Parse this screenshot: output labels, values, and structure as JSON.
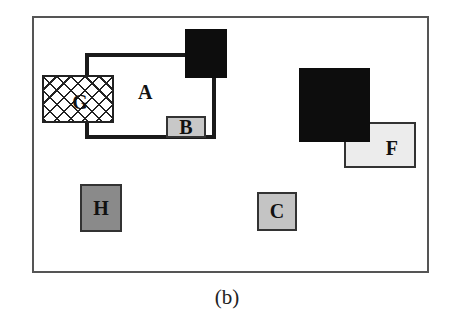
{
  "figure": {
    "caption": "(b)",
    "regions": [
      {
        "id": "A",
        "label": "A",
        "style": "thick-outline",
        "fill": "#ffffff"
      },
      {
        "id": "G",
        "label": "G",
        "style": "crosshatch",
        "fill": "#ffffff"
      },
      {
        "id": "B",
        "label": "B",
        "style": "filled",
        "fill": "#c8c8c8"
      },
      {
        "id": "F",
        "label": "F",
        "style": "filled",
        "fill": "#ececec"
      },
      {
        "id": "H",
        "label": "H",
        "style": "filled",
        "fill": "#8a8a8a"
      },
      {
        "id": "C",
        "label": "C",
        "style": "filled",
        "fill": "#c4c4c4"
      },
      {
        "id": "black-top",
        "label": "",
        "style": "solid",
        "fill": "#0d0d0d"
      },
      {
        "id": "black-big",
        "label": "",
        "style": "solid",
        "fill": "#0d0d0d"
      }
    ]
  }
}
